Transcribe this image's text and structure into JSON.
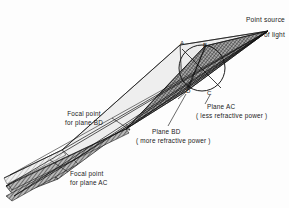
{
  "figure": {
    "type": "optics-ray-diagram",
    "background": "#fdfdfd",
    "ink": "#1a1a1a"
  },
  "labels": {
    "point_source_line1": "Point source",
    "point_source_line2": "of light",
    "plane_ac_line1": "Plane AC",
    "plane_ac_line2": "( less refractive power )",
    "plane_bd_line1": "Plane BD",
    "plane_bd_line2": "( more refractive power )",
    "focal_bd_line1": "Focal point",
    "focal_bd_line2": "for plane BD",
    "focal_ac_line1": "Focal point",
    "focal_ac_line2": "for plane AC"
  },
  "points": {
    "a": "A",
    "b": "B",
    "c": "C",
    "d": "D"
  },
  "geometry": {
    "source": {
      "x": 268,
      "y": 31
    },
    "pupil_circle": {
      "cx": 202,
      "cy": 68,
      "r": 23
    },
    "focal_bd": {
      "x": 126,
      "y": 129
    },
    "focal_ac": {
      "x": 74,
      "y": 160
    },
    "beam_ac_fill": "#e9e9e9",
    "beam_bd_fill": "#9a9a9a",
    "hatch_color": "#3a3a3a",
    "outline_color": "#111111"
  }
}
